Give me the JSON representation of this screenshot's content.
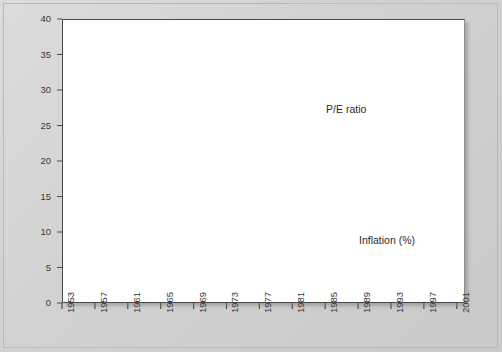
{
  "figure": {
    "background_color": "#d4d4d4",
    "plot_background_color": "#ffffff",
    "axis_color": "#4a4a4a"
  },
  "labels": {
    "pe_label": "P/E ratio",
    "inflation_label": "Inflation (%)"
  },
  "chart_data": {
    "type": "line",
    "title": "",
    "subtitle": "",
    "xlabel": "",
    "ylabel": "",
    "xlim": [
      1953,
      2002
    ],
    "ylim": [
      0,
      40
    ],
    "yticks": [
      0,
      5,
      10,
      15,
      20,
      25,
      30,
      35,
      40
    ],
    "xticks": [
      1953,
      1957,
      1961,
      1965,
      1969,
      1973,
      1977,
      1981,
      1985,
      1989,
      1993,
      1997,
      2001
    ],
    "xtick_labels": [
      "1953",
      "1957",
      "1961",
      "1965",
      "1969",
      "1973",
      "1977",
      "1981",
      "1985",
      "1989",
      "1993",
      "1997",
      "2001"
    ],
    "ytick_labels": [
      "0",
      "5",
      "10",
      "15",
      "20",
      "25",
      "30",
      "35",
      "40"
    ],
    "grid": false,
    "legend_position": "inline-annotation",
    "series": [
      {
        "name": "P/E ratio",
        "color": "#1c1c1c",
        "line_width": 1.5,
        "label_x": 1989,
        "label_y": 27.2,
        "x": [
          1954,
          1955,
          1956,
          1957,
          1958,
          1959,
          1960,
          1961,
          1962,
          1963,
          1964,
          1965,
          1966,
          1967,
          1968,
          1969,
          1970,
          1971,
          1972,
          1973,
          1974,
          1975,
          1976,
          1977,
          1978,
          1979,
          1980,
          1981,
          1982,
          1983,
          1984,
          1985,
          1986,
          1987,
          1988,
          1989,
          1990,
          1991,
          1992,
          1993,
          1994,
          1995,
          1996,
          1997,
          1998,
          1999,
          2000,
          2001
        ],
        "y": [
          12.8,
          13.5,
          12.9,
          13.0,
          15.7,
          17.6,
          17.8,
          22.0,
          17.7,
          18.6,
          18.4,
          18.0,
          15.3,
          17.8,
          18.5,
          18.7,
          16.4,
          18.5,
          18.8,
          15.0,
          11.5,
          8.5,
          11.0,
          10.5,
          9.0,
          8.3,
          9.0,
          9.2,
          8.6,
          11.5,
          10.0,
          12.6,
          13.0,
          14.2,
          12.9,
          13.0,
          15.5,
          17.1,
          21.0,
          23.6,
          21.0,
          17.0,
          16.7,
          19.5,
          25.0,
          28.6,
          25.4,
          33.5
        ]
      },
      {
        "name": "Inflation (%)",
        "color": "#6e6e6e",
        "line_width": 1.1,
        "label_x": 1993,
        "label_y": 8.8,
        "x": [
          1955,
          1956,
          1957,
          1958,
          1959,
          1960,
          1961,
          1962,
          1963,
          1964,
          1965,
          1966,
          1967,
          1968,
          1969,
          1970,
          1971,
          1972,
          1973,
          1974,
          1975,
          1976,
          1977,
          1978,
          1979,
          1980,
          1981,
          1982,
          1983,
          1984,
          1985,
          1986,
          1987,
          1988,
          1989,
          1990,
          1991,
          1992,
          1993,
          1994,
          1995,
          1996,
          1997,
          1998,
          1999,
          2000,
          2001
        ],
        "y": [
          0.2,
          2.9,
          3.1,
          2.1,
          2.0,
          1.8,
          1.5,
          0.7,
          1.4,
          1.6,
          1.5,
          2.4,
          3.3,
          3.5,
          5.2,
          6.3,
          5.5,
          3.5,
          3.5,
          11.3,
          11.0,
          5.0,
          6.2,
          7.8,
          13.0,
          12.5,
          10.5,
          6.0,
          3.2,
          3.2,
          3.3,
          1.2,
          4.0,
          4.1,
          4.8,
          6.3,
          4.0,
          3.3,
          2.8,
          2.6,
          2.7,
          2.5,
          3.5,
          1.6,
          1.5,
          3.4,
          2.0
        ]
      }
    ]
  }
}
